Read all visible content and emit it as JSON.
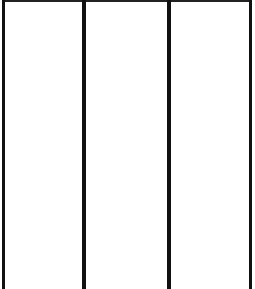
{
  "diagram": {
    "colors": {
      "background": "#ffffff",
      "line": "#111111",
      "top_border": "#222222"
    },
    "panels": [
      {
        "id": "panel-1",
        "left": 5,
        "width": 77,
        "label": ""
      },
      {
        "id": "panel-2",
        "left": 86,
        "width": 81,
        "label": ""
      },
      {
        "id": "panel-3",
        "left": 171,
        "width": 78,
        "label": ""
      }
    ],
    "dividers": [
      {
        "x": 2,
        "width": 3
      },
      {
        "x": 82,
        "width": 4
      },
      {
        "x": 167,
        "width": 4
      },
      {
        "x": 249,
        "width": 3
      }
    ]
  }
}
